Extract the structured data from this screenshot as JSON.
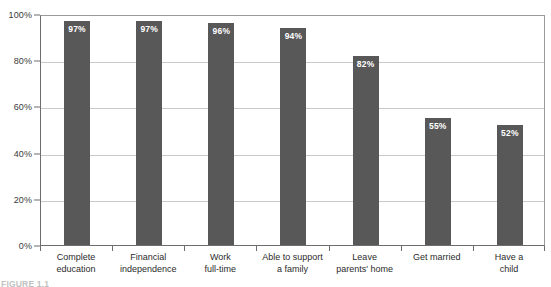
{
  "chart_data": {
    "type": "bar",
    "title": "",
    "subtitle": "",
    "xlabel": "",
    "ylabel": "",
    "categories": [
      "Complete\neducation",
      "Financial\nindependence",
      "Work\nfull-time",
      "Able to support\na family",
      "Leave\nparents' home",
      "Get married",
      "Have a\nchild"
    ],
    "values": [
      97,
      97,
      96,
      94,
      82,
      55,
      52
    ],
    "value_labels": [
      "97%",
      "97%",
      "96%",
      "94%",
      "82%",
      "55%",
      "52%"
    ],
    "ylim": [
      0,
      100
    ],
    "yticks": [
      0,
      20,
      40,
      60,
      80,
      100
    ],
    "ytick_labels": [
      "0%",
      "20%",
      "40%",
      "60%",
      "80%",
      "100%"
    ],
    "grid": true,
    "grid_axis": "y",
    "legend": false,
    "legend_position": "none",
    "bar_color": "#585858",
    "grid_color": "#c9c9c9",
    "axis_color": "#6d6d6d",
    "value_label_color": "#ffffff",
    "plot_background": "#ffffff"
  },
  "figure": {
    "caption": "FIGURE 1.1"
  }
}
